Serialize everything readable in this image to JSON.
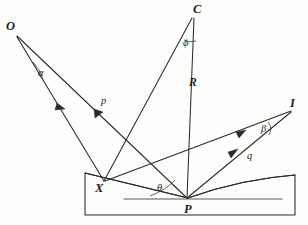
{
  "figure": {
    "ink_color": "#2b2b2b",
    "background_color": "#fdfdfb",
    "points": [
      {
        "id": "O",
        "label": "O",
        "x": 12,
        "y": 29,
        "role": "object-point"
      },
      {
        "id": "C",
        "label": "C",
        "x": 197,
        "y": 11,
        "role": "center-of-curvature"
      },
      {
        "id": "I",
        "label": "I",
        "x": 293,
        "y": 105,
        "role": "image-point"
      },
      {
        "id": "X",
        "label": "X",
        "x": 100,
        "y": 189,
        "role": "mirror-point-x"
      },
      {
        "id": "P",
        "label": "P",
        "x": 188,
        "y": 211,
        "role": "mirror-vertex-p"
      }
    ],
    "angles": [
      {
        "id": "alpha",
        "label": "α",
        "x": 41,
        "y": 74,
        "at": "O"
      },
      {
        "id": "phi",
        "label": "ϕ",
        "x": 186,
        "y": 44,
        "at": "C"
      },
      {
        "id": "beta",
        "label": "β",
        "x": 264,
        "y": 130,
        "at": "I"
      },
      {
        "id": "theta",
        "label": "θ",
        "x": 160,
        "y": 189,
        "at": "P"
      }
    ],
    "ray_labels": [
      {
        "id": "p",
        "label": "p",
        "x": 104,
        "y": 102,
        "describes": "object-distance-ray-O-to-X"
      },
      {
        "id": "q",
        "label": "q",
        "x": 250,
        "y": 157,
        "describes": "image-distance-ray-X-to-I"
      },
      {
        "id": "R",
        "label": "R",
        "x": 192,
        "y": 83,
        "describes": "radius-of-curvature-C-to-P"
      }
    ],
    "segments": [
      {
        "id": "O-X",
        "from": "O",
        "to": "X",
        "arrow": false,
        "note": "incident ray O to X"
      },
      {
        "id": "O-P",
        "from": "O",
        "to": "P",
        "arrow": true,
        "note": "incident ray O to P with mid arrow"
      },
      {
        "id": "C-P",
        "from": "C",
        "to": "P",
        "arrow": false,
        "note": "radius R, normal at vertex P"
      },
      {
        "id": "C-X",
        "from": "C",
        "to": "X",
        "arrow": false,
        "note": "radius to X, normal at X"
      },
      {
        "id": "X-I",
        "from": "X",
        "to": "I",
        "arrow": true,
        "note": "reflected ray X to I, label q"
      },
      {
        "id": "P-I",
        "from": "P",
        "to": "I",
        "arrow": true,
        "note": "reflected ray P to I"
      },
      {
        "id": "tangent-at-P",
        "from": "axis-left",
        "to": "axis-right",
        "arrow": false,
        "note": "horizontal tangent / optical axis through P"
      }
    ],
    "mirror": {
      "id": "concave-mirror-block",
      "shape": "trapezoid-with-concave-top",
      "left_x": 85,
      "right_x": 295,
      "bottom_y": 215,
      "left_top_y": 173,
      "right_top_y": 175,
      "vertex_x": 188,
      "vertex_y": 198
    }
  }
}
